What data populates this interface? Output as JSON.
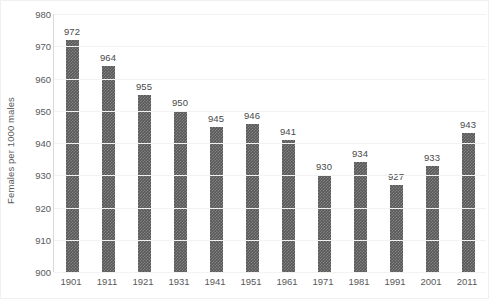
{
  "chart_data": {
    "type": "bar",
    "title": "",
    "xlabel": "",
    "ylabel": "Females per 1000 males",
    "ylim": [
      900,
      980
    ],
    "ytick_step": 10,
    "yticks": [
      980,
      970,
      960,
      950,
      940,
      930,
      920,
      910,
      900
    ],
    "grid": true,
    "legend": null,
    "categories": [
      "1901",
      "1911",
      "1921",
      "1931",
      "1941",
      "1951",
      "1961",
      "1971",
      "1981",
      "1991",
      "2001",
      "2011"
    ],
    "values": [
      972,
      964,
      955,
      950,
      945,
      946,
      941,
      930,
      934,
      927,
      933,
      943
    ],
    "data_labels": [
      "972",
      "964",
      "955",
      "950",
      "945",
      "946",
      "941",
      "930",
      "934",
      "927",
      "933",
      "943"
    ],
    "bar_color": "#595959",
    "gridline_color": "#f2f2f2",
    "axis_text_color": "#595959",
    "background_color": "#ffffff"
  }
}
